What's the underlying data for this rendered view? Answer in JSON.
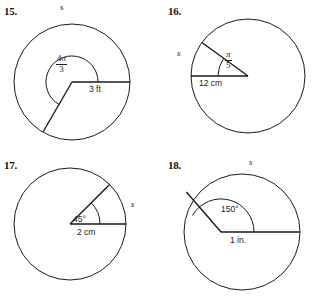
{
  "page": {
    "background": "#ffffff",
    "ink": "#1a1a1a"
  },
  "problems": [
    {
      "number": "15.",
      "arc_label": "s",
      "angle_type": "fraction",
      "angle_numerator": "4π",
      "angle_denominator": "3",
      "radius_label": "3 ft",
      "radius_value": "3",
      "radius_unit": "ft",
      "angle_measure": "4π/3",
      "angle_unit": "radians"
    },
    {
      "number": "16.",
      "arc_label": "s",
      "angle_type": "fraction",
      "angle_numerator": "π",
      "angle_denominator": "5",
      "radius_label": "12 cm",
      "radius_value": "12",
      "radius_unit": "cm",
      "angle_measure": "π/5",
      "angle_unit": "radians"
    },
    {
      "number": "17.",
      "arc_label": "s",
      "angle_type": "degrees",
      "angle_label": "45°",
      "radius_label": "2 cm",
      "radius_value": "2",
      "radius_unit": "cm",
      "angle_measure": "45",
      "angle_unit": "degrees"
    },
    {
      "number": "18.",
      "arc_label": "s",
      "angle_type": "degrees",
      "angle_label": "150°",
      "radius_label": "1 in.",
      "radius_value": "1",
      "radius_unit": "in.",
      "angle_measure": "150",
      "angle_unit": "degrees"
    }
  ]
}
